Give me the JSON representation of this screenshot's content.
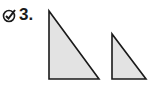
{
  "exercise": {
    "number": "3.",
    "icon": "check-circle-icon"
  },
  "figures": [
    {
      "name": "large-right-triangle",
      "points": "49,11 49,79 99,79",
      "fill": "#e3e3e3",
      "stroke": "#1a1a1a"
    },
    {
      "name": "small-right-triangle",
      "points": "112,34 112,79 146,79",
      "fill": "#e3e3e3",
      "stroke": "#1a1a1a"
    }
  ]
}
